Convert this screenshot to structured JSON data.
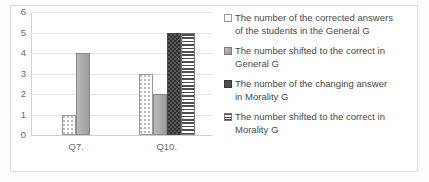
{
  "chart_data": {
    "type": "bar",
    "title": "",
    "subtitle": "",
    "xlabel": "",
    "ylabel": "",
    "categories": [
      "Q7.",
      "Q10."
    ],
    "ylim": [
      0,
      6
    ],
    "y_ticks": [
      0,
      1,
      2,
      3,
      4,
      5,
      6
    ],
    "grid": true,
    "legend_position": "right",
    "series": [
      {
        "name": "The number of the corrected answers of the students in the General G",
        "pattern": "light-dotted",
        "values": [
          1,
          3
        ]
      },
      {
        "name": "The number shifted to the correct in General G",
        "pattern": "solid-gray",
        "values": [
          4,
          2
        ]
      },
      {
        "name": "The number of the changing answer in Morality G",
        "pattern": "dark-dotted",
        "values": [
          0,
          5
        ]
      },
      {
        "name": "The number shifted to the correct in Morality G",
        "pattern": "horizontal-stripes",
        "values": [
          0,
          5
        ]
      }
    ]
  },
  "axis": {
    "y_tick_labels": [
      "0",
      "1",
      "2",
      "3",
      "4",
      "5",
      "6"
    ],
    "x_tick_labels": [
      "Q7.",
      "Q10."
    ]
  },
  "legend": {
    "entries": [
      {
        "label": "The number of the corrected answers\nof the students in the General G"
      },
      {
        "label": "The number shifted to the correct in\nGeneral G"
      },
      {
        "label": "The number of the changing answer\nin Morality G"
      },
      {
        "label": "The number shifted to the correct in\nMorality G"
      }
    ]
  },
  "colors": {
    "gridline": "#e4e4e4",
    "axis": "#d2d2d2",
    "text": "#6b6b6b",
    "legend_text": "#4a4a4a",
    "series_light": "#fbfbfb",
    "series_gray": "#a9a9a9",
    "series_dark": "#595959",
    "series_striped": "#4f4f4f"
  }
}
